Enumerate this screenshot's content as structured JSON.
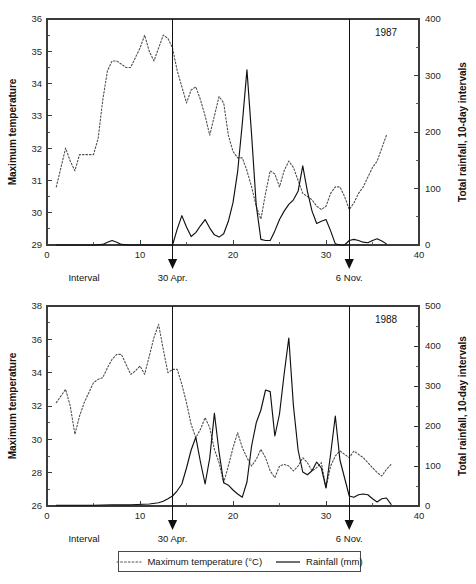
{
  "figure": {
    "legend": {
      "temperature_label": "Maximum temperature (°C)",
      "rainfall_label": "Rainfall (mm)",
      "temperature_style": "dotted",
      "rainfall_style": "solid"
    },
    "colors": {
      "temperature_line": "#4f4f4f",
      "rainfall_line": "#101010",
      "axis": "#3b3b3b",
      "background": "#ffffff"
    }
  },
  "panels": [
    {
      "id": "1987",
      "year_label": "1987",
      "y_left_title": "Maximum temperature",
      "y_right_title": "Total rainfall, 10-day intervals",
      "x_title": "Interval",
      "y_left_ticks": [
        "29",
        "30",
        "31",
        "32",
        "33",
        "34",
        "35",
        "36"
      ],
      "y_right_ticks": [
        "0",
        "100",
        "200",
        "300",
        "400"
      ],
      "x_ticks": [
        "0",
        "10",
        "20",
        "30",
        "40"
      ],
      "markers": [
        {
          "label": "30 Apr.",
          "interval": 13.5
        },
        {
          "label": "6 Nov.",
          "interval": 32.5
        }
      ]
    },
    {
      "id": "1988",
      "year_label": "1988",
      "y_left_title": "Maximum temperature",
      "y_right_title": "Total rainfall, 10-day intervals",
      "x_title": "Interval",
      "y_left_ticks": [
        "26",
        "28",
        "30",
        "32",
        "34",
        "36",
        "38"
      ],
      "y_right_ticks": [
        "0",
        "100",
        "200",
        "300",
        "400",
        "500"
      ],
      "x_ticks": [
        "0",
        "10",
        "20",
        "30",
        "40"
      ],
      "markers": [
        {
          "label": "30 Apr.",
          "interval": 13.5
        },
        {
          "label": "6 Nov.",
          "interval": 32.5
        }
      ]
    }
  ],
  "chart_data": [
    {
      "type": "line",
      "title": "1987",
      "xlabel": "Interval",
      "ylabel": "Maximum temperature",
      "y2label": "Total rainfall, 10-day intervals",
      "xlim": [
        0,
        40
      ],
      "ylim": [
        29,
        36
      ],
      "y2lim": [
        0,
        400
      ],
      "grid": false,
      "legend_position": "below-figure",
      "annotations": [
        {
          "text": "30 Apr.",
          "x": 13.5
        },
        {
          "text": "6 Nov.",
          "x": 32.5
        },
        {
          "text": "1987",
          "x": 35.5,
          "y": 35.6
        }
      ],
      "series": [
        {
          "name": "Maximum temperature (°C)",
          "axis": "left",
          "style": "dotted",
          "x": [
            1,
            1.5,
            2,
            2.5,
            3,
            3.5,
            4,
            4.5,
            5,
            5.5,
            6,
            6.5,
            7,
            7.5,
            8,
            8.5,
            9,
            9.5,
            10,
            10.5,
            11,
            11.5,
            12,
            12.5,
            13,
            13.5,
            14,
            14.5,
            15,
            15.5,
            16,
            16.5,
            17,
            17.5,
            18,
            18.5,
            19,
            19.5,
            20,
            20.5,
            21,
            21.5,
            22,
            22.5,
            23,
            23.5,
            24,
            24.5,
            25,
            25.5,
            26,
            26.5,
            27,
            27.5,
            28,
            28.5,
            29,
            29.5,
            30,
            30.5,
            31,
            31.5,
            32,
            32.5,
            33,
            33.5,
            34,
            34.5,
            35,
            35.5,
            36,
            36.5
          ],
          "values": [
            30.8,
            31.4,
            32.0,
            31.6,
            31.3,
            31.8,
            31.8,
            31.8,
            31.8,
            32.3,
            33.5,
            34.4,
            34.7,
            34.7,
            34.6,
            34.5,
            34.5,
            34.8,
            35.1,
            35.5,
            35.0,
            34.7,
            35.1,
            35.5,
            35.4,
            35.1,
            34.4,
            33.9,
            33.4,
            33.8,
            33.9,
            33.5,
            33.0,
            32.4,
            33.0,
            33.6,
            33.4,
            32.4,
            31.9,
            31.7,
            31.7,
            31.3,
            30.8,
            30.2,
            29.8,
            30.6,
            31.3,
            31.2,
            30.8,
            31.3,
            31.6,
            31.4,
            31.0,
            30.6,
            30.5,
            30.4,
            30.2,
            30.1,
            30.2,
            30.6,
            30.8,
            30.8,
            30.5,
            30.1,
            30.3,
            30.6,
            30.8,
            31.1,
            31.4,
            31.6,
            32.0,
            32.4
          ]
        },
        {
          "name": "Rainfall (mm)",
          "axis": "right",
          "style": "solid",
          "x": [
            1,
            2,
            3,
            4,
            5,
            6,
            6.5,
            7,
            7.5,
            8,
            9,
            10,
            11,
            12,
            13,
            13.5,
            14,
            14.5,
            15,
            15.5,
            16,
            16.5,
            17,
            17.5,
            18,
            18.5,
            19,
            19.5,
            20,
            20.5,
            21,
            21.5,
            22,
            22.5,
            23,
            23.5,
            24,
            24.5,
            25,
            25.5,
            26,
            26.5,
            27,
            27.5,
            28,
            28.5,
            29,
            29.5,
            30,
            30.5,
            31,
            31.5,
            32,
            32.5,
            33,
            33.5,
            34,
            34.5,
            35,
            35.5,
            36,
            36.5
          ],
          "values": [
            0,
            0,
            0,
            0,
            0,
            1,
            5,
            8,
            5,
            1,
            0,
            0,
            0,
            0,
            0,
            0,
            28,
            52,
            32,
            15,
            22,
            34,
            45,
            30,
            18,
            14,
            20,
            42,
            75,
            130,
            215,
            310,
            195,
            70,
            10,
            8,
            8,
            25,
            45,
            60,
            72,
            80,
            95,
            140,
            95,
            60,
            38,
            42,
            45,
            25,
            2,
            0,
            0,
            8,
            10,
            8,
            5,
            4,
            8,
            11,
            7,
            2
          ]
        }
      ]
    },
    {
      "type": "line",
      "title": "1988",
      "xlabel": "Interval",
      "ylabel": "Maximum temperature",
      "y2label": "Total rainfall, 10-day intervals",
      "xlim": [
        0,
        40
      ],
      "ylim": [
        26,
        38
      ],
      "y2lim": [
        0,
        500
      ],
      "grid": false,
      "legend_position": "below-figure",
      "annotations": [
        {
          "text": "30 Apr.",
          "x": 13.5
        },
        {
          "text": "6 Nov.",
          "x": 32.5
        },
        {
          "text": "1988",
          "x": 35.5,
          "y": 37.3
        }
      ],
      "series": [
        {
          "name": "Maximum temperature (°C)",
          "axis": "left",
          "style": "dotted",
          "x": [
            1,
            1.5,
            2,
            2.5,
            3,
            3.5,
            4,
            4.5,
            5,
            5.5,
            6,
            6.5,
            7,
            7.5,
            8,
            8.5,
            9,
            9.5,
            10,
            10.5,
            11,
            11.5,
            12,
            12.5,
            13,
            13.5,
            14,
            14.5,
            15,
            15.5,
            16,
            16.5,
            17,
            17.5,
            18,
            18.5,
            19,
            19.5,
            20,
            20.5,
            21,
            21.5,
            22,
            22.5,
            23,
            23.5,
            24,
            24.5,
            25,
            25.5,
            26,
            26.5,
            27,
            27.5,
            28,
            28.5,
            29,
            29.5,
            30,
            30.5,
            31,
            31.5,
            32,
            32.5,
            33,
            33.5,
            34,
            34.5,
            35,
            35.5,
            36,
            36.5,
            37
          ],
          "values": [
            32.2,
            32.6,
            33.0,
            32.0,
            30.3,
            31.4,
            32.2,
            32.8,
            33.4,
            33.6,
            33.7,
            34.3,
            34.8,
            35.1,
            35.1,
            34.5,
            33.9,
            34.1,
            34.4,
            33.9,
            35.0,
            36.1,
            36.9,
            35.4,
            34.0,
            34.2,
            34.2,
            33.3,
            32.2,
            30.9,
            30.1,
            30.6,
            31.3,
            30.7,
            29.4,
            28.6,
            27.4,
            28.4,
            29.5,
            30.4,
            29.5,
            28.9,
            28.4,
            28.8,
            29.4,
            28.9,
            28.1,
            27.7,
            28.4,
            28.5,
            28.4,
            28.1,
            28.4,
            28.9,
            28.6,
            28.1,
            28.3,
            28.6,
            27.1,
            28.4,
            29.0,
            29.3,
            29.1,
            28.9,
            29.3,
            29.1,
            28.9,
            28.6,
            28.3,
            28.0,
            27.8,
            28.2,
            28.5
          ]
        },
        {
          "name": "Rainfall (mm)",
          "axis": "right",
          "style": "solid",
          "x": [
            1,
            3,
            5,
            7,
            9,
            11,
            12,
            12.5,
            13,
            13.5,
            14,
            14.5,
            15,
            15.5,
            16,
            16.5,
            17,
            17.5,
            18,
            18.5,
            19,
            19.5,
            20,
            20.5,
            21,
            21.5,
            22,
            22.5,
            23,
            23.5,
            24,
            24.5,
            25,
            25.5,
            26,
            26.5,
            27,
            27.5,
            28,
            28.5,
            29,
            29.5,
            30,
            30.5,
            31,
            31.5,
            32,
            32.5,
            33,
            33.5,
            34,
            34.5,
            35,
            35.5,
            36,
            36.5,
            37
          ],
          "values": [
            2,
            2,
            2,
            3,
            3,
            5,
            8,
            12,
            18,
            25,
            38,
            55,
            95,
            140,
            172,
            110,
            55,
            120,
            232,
            135,
            58,
            52,
            40,
            30,
            22,
            60,
            150,
            208,
            240,
            290,
            286,
            175,
            230,
            330,
            420,
            250,
            140,
            85,
            78,
            88,
            110,
            95,
            45,
            130,
            225,
            115,
            70,
            25,
            22,
            28,
            30,
            28,
            18,
            10,
            18,
            20,
            4
          ]
        }
      ]
    }
  ]
}
